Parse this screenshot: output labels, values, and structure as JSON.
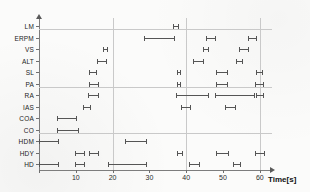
{
  "chart_data": {
    "type": "bar",
    "title": "",
    "xlabel": "Time[s]",
    "ylabel": "Variables",
    "xlim": [
      0,
      63
    ],
    "ylim": [
      0,
      14
    ],
    "grid": true,
    "legend": "none",
    "orientation": "horizontal",
    "note": "Horizontal interval (range) markers per variable; each marker shows start and end time in seconds.",
    "xticks": [
      0,
      10,
      20,
      30,
      40,
      50,
      60
    ],
    "xtick_labels": [
      "",
      "10",
      "20",
      "30",
      "40",
      "50",
      "60"
    ],
    "categories": [
      "LM",
      "ERPM",
      "VS",
      "ALT",
      "SL",
      "PA",
      "RA",
      "IAS",
      "COA",
      "CO",
      "HDM",
      "HDY",
      "HD"
    ],
    "series": [
      {
        "name": "LM",
        "intervals": [
          [
            36.5,
            38.0
          ]
        ]
      },
      {
        "name": "ERPM",
        "intervals": [
          [
            28.5,
            37.0
          ],
          [
            45.5,
            48.0
          ],
          [
            56.8,
            59.2
          ]
        ]
      },
      {
        "name": "VS",
        "intervals": [
          [
            17.4,
            18.8
          ],
          [
            44.6,
            46.2
          ],
          [
            54.3,
            57.1
          ]
        ]
      },
      {
        "name": "ALT",
        "intervals": [
          [
            15.8,
            18.5
          ],
          [
            41.8,
            44.8
          ],
          [
            53.5,
            55.4
          ]
        ]
      },
      {
        "name": "SL",
        "intervals": [
          [
            13.6,
            15.8
          ],
          [
            37.5,
            38.6
          ],
          [
            48.1,
            51.4
          ],
          [
            59.0,
            60.9
          ]
        ]
      },
      {
        "name": "PA",
        "intervals": [
          [
            13.6,
            16.3
          ],
          [
            37.5,
            38.6
          ],
          [
            48.1,
            51.4
          ],
          [
            58.7,
            61.1
          ]
        ]
      },
      {
        "name": "RA",
        "intervals": [
          [
            13.3,
            16.3
          ],
          [
            37.2,
            46.2
          ],
          [
            47.8,
            58.7
          ],
          [
            59.0,
            61.1
          ]
        ]
      },
      {
        "name": "IAS",
        "intervals": [
          [
            11.9,
            14.1
          ],
          [
            38.6,
            41.3
          ],
          [
            50.5,
            53.5
          ]
        ]
      },
      {
        "name": "COA",
        "intervals": [
          [
            4.9,
            10.3
          ]
        ]
      },
      {
        "name": "CO",
        "intervals": [
          [
            4.9,
            10.9
          ]
        ]
      },
      {
        "name": "HDM",
        "intervals": [
          [
            0.0,
            5.4
          ],
          [
            23.4,
            29.3
          ]
        ]
      },
      {
        "name": "HDY",
        "intervals": [
          [
            9.8,
            12.5
          ],
          [
            13.6,
            16.3
          ],
          [
            37.5,
            39.1
          ],
          [
            48.1,
            51.6
          ],
          [
            58.7,
            61.4
          ]
        ]
      },
      {
        "name": "HD",
        "intervals": [
          [
            0.0,
            5.4
          ],
          [
            9.8,
            12.5
          ],
          [
            18.7,
            29.3
          ],
          [
            40.8,
            43.7
          ],
          [
            52.7,
            54.9
          ]
        ]
      }
    ]
  },
  "axes": {
    "x_title": "Time[s]",
    "y_title": "Variables"
  }
}
